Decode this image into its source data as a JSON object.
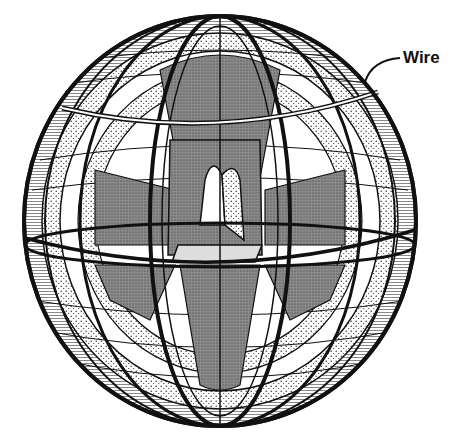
{
  "diagram": {
    "labels": [
      {
        "text": "Wire",
        "x": 403,
        "y": 48,
        "points_to": "horizontal ring band near top of sphere"
      }
    ],
    "colors": {
      "ink": "#111111",
      "paper": "#ffffff",
      "gray_fill": "#8a8a8a",
      "stipple_fill": "#c8c8c8"
    },
    "geometry": {
      "sphere": {
        "cx": 220,
        "cy": 221,
        "rx": 196,
        "ry": 205
      },
      "wire_ring": {
        "cy": 125,
        "rx": 158,
        "ry": 14
      },
      "equator_plane": {
        "cy": 245,
        "rx": 195,
        "ry": 22
      }
    }
  }
}
